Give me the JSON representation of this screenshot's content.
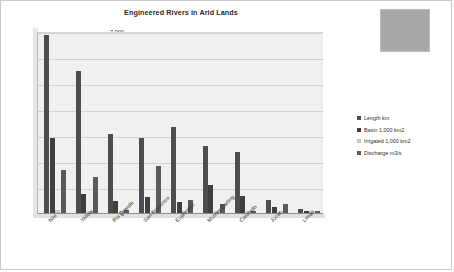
{
  "chart_data": {
    "type": "bar",
    "title": "Engineered Rivers in Arid Lands",
    "xlabel": "",
    "ylabel": "",
    "ylim": [
      0,
      7000
    ],
    "ytick_labels": [
      "7,000",
      "6,000",
      "5,000",
      "4,000",
      "3,000",
      "2,000",
      "1,000",
      "0"
    ],
    "ytick_values": [
      7000,
      6000,
      5000,
      4000,
      3000,
      2000,
      1000,
      0
    ],
    "grid": true,
    "legend_position": "right",
    "categories": [
      "Nile",
      "Yellow",
      "Rio Grande",
      "San Francisco",
      "Euphrates",
      "Murray-Darling",
      "Colorado",
      "Jucar",
      "Limari"
    ],
    "series": [
      {
        "name": "Length km",
        "color": "#4d4d4d",
        "values": [
          6850,
          5460,
          3050,
          2900,
          3300,
          2575,
          2330,
          500,
          160
        ]
      },
      {
        "name": "Basin 1,000 km2",
        "color": "#3f3f3f",
        "values": [
          2900,
          750,
          470,
          620,
          440,
          1060,
          640,
          230,
          90
        ]
      },
      {
        "name": "Irrigated 1,000 km2",
        "color": "#d2d2d2",
        "values": [
          100,
          55,
          30,
          60,
          45,
          20,
          25,
          15,
          10
        ]
      },
      {
        "name": "Discharge m3/s",
        "color": "#5a5a5a",
        "values": [
          1650,
          1400,
          110,
          1800,
          490,
          340,
          80,
          330,
          75
        ]
      }
    ]
  },
  "decoration": {
    "placeholder_color": "#a8a8a8"
  }
}
